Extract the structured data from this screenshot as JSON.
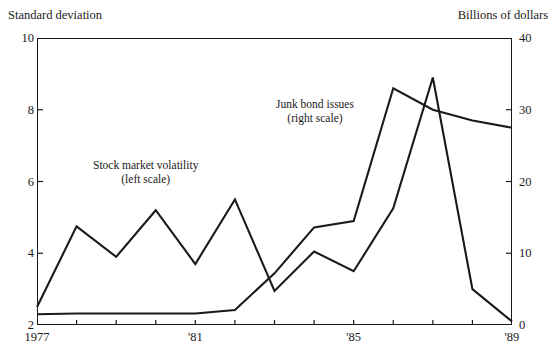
{
  "chart_data": {
    "type": "line",
    "title": "",
    "xlabel": "",
    "ylabel": "Standard deviation",
    "y2label": "Billions of dollars",
    "x": [
      1977,
      1978,
      1979,
      1980,
      1981,
      1982,
      1983,
      1984,
      1985,
      1986,
      1987,
      1988,
      1989
    ],
    "xlim": [
      1977,
      1989
    ],
    "ylim": [
      2,
      10
    ],
    "y2lim": [
      0,
      40
    ],
    "grid": false,
    "legend_position": "inline-annotation",
    "left_ticks": [
      "2",
      "4",
      "6",
      "8",
      "10"
    ],
    "left_tick_values": [
      2,
      4,
      6,
      8,
      10
    ],
    "right_ticks": [
      "0",
      "10",
      "20",
      "30",
      "40"
    ],
    "right_tick_values": [
      0,
      10,
      20,
      30,
      40
    ],
    "x_tick_labels": [
      "1977",
      "'81",
      "'85",
      "'89"
    ],
    "x_tick_label_values": [
      1977,
      1981,
      1985,
      1989
    ],
    "series": [
      {
        "name": "Stock market volatility",
        "scale": "left",
        "annotation": "Stock market volatility",
        "annotation_scale": "(left scale)",
        "values": [
          2.5,
          4.75,
          3.9,
          5.2,
          3.7,
          5.5,
          2.95,
          4.05,
          3.5,
          5.25,
          8.9,
          3.0,
          2.1
        ]
      },
      {
        "name": "Junk bond issues",
        "scale": "right",
        "annotation": "Junk bond issues",
        "annotation_scale": "(right scale)",
        "values": [
          1.5,
          1.6,
          1.6,
          1.6,
          1.6,
          2.1,
          7.2,
          13.6,
          14.5,
          33.0,
          30.0,
          28.5,
          27.5
        ]
      }
    ]
  }
}
